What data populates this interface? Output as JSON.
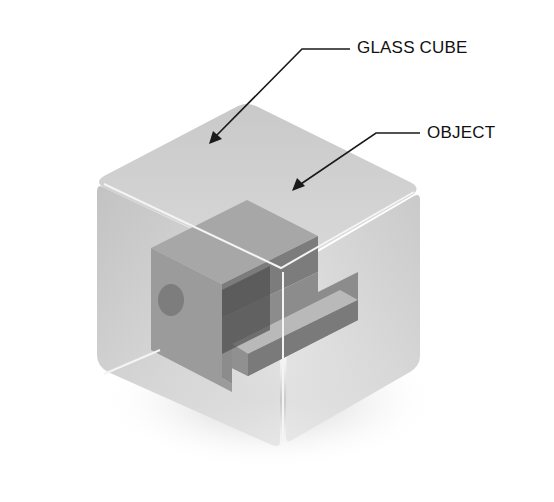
{
  "diagram": {
    "labels": {
      "glass_cube": "GLASS CUBE",
      "object": "OBJECT"
    },
    "colors": {
      "leader_line": "#1a1a1a",
      "glass_light": "#d8d8d8",
      "glass_mid": "#bdbdbd",
      "object_dark": "#6e6e6e",
      "object_mid": "#9a9a9a",
      "object_light": "#b8b8b8"
    }
  }
}
